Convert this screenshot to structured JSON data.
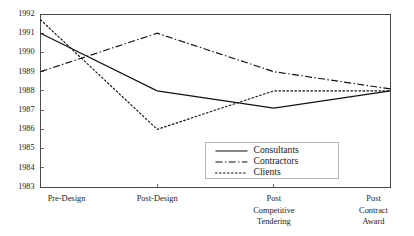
{
  "chart_data": {
    "type": "line",
    "title": "",
    "subtitle": "",
    "xlabel": "",
    "ylabel": "",
    "categories": [
      "Pre-Design",
      "Post-Design",
      "Post Competitive Tendering",
      "Post Contract Award"
    ],
    "category_lines": [
      [
        "Pre-Design"
      ],
      [
        "Post-Design"
      ],
      [
        "Post",
        "Competitive",
        "Tendering"
      ],
      [
        "Post",
        "Contract",
        "Award"
      ]
    ],
    "ylim": [
      1983,
      1992
    ],
    "ytick_labels": [
      "1983",
      "1984",
      "1985",
      "1986",
      "1987",
      "1988",
      "1989",
      "1990",
      "1991",
      "1992"
    ],
    "ytick_values": [
      1983,
      1984,
      1985,
      1986,
      1987,
      1988,
      1989,
      1990,
      1991,
      1992
    ],
    "grid": false,
    "legend_position": "lower-right",
    "series": [
      {
        "name": "Consultants",
        "style": "solid",
        "color": "#111111",
        "values": [
          1991.0,
          1988.0,
          1987.1,
          1988.0
        ]
      },
      {
        "name": "Contractors",
        "style": "dash-dot",
        "color": "#111111",
        "values": [
          1989.0,
          1991.0,
          1989.0,
          1988.1
        ]
      },
      {
        "name": "Clients",
        "style": "dotted",
        "color": "#111111",
        "values": [
          1991.7,
          1986.0,
          1988.0,
          1988.0
        ]
      }
    ]
  }
}
